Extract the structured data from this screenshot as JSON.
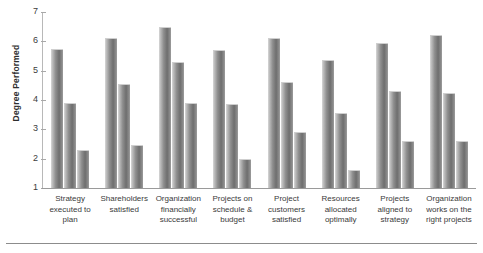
{
  "chart_data": {
    "type": "bar",
    "title": "",
    "subtitle": "",
    "xlabel": "",
    "ylabel": "Degree Performed",
    "ylim": [
      1,
      7
    ],
    "yticks": [
      1,
      2,
      3,
      4,
      5,
      6,
      7
    ],
    "grid": false,
    "legend": "none",
    "orientation": "vertical",
    "grouping": "clustered",
    "categories": [
      "Strategy executed to plan",
      "Shareholders satisfied",
      "Organization financially successful",
      "Projects on schedule & budget",
      "Project customers satisfied",
      "Resources allocated optimally",
      "Projects aligned to strategy",
      "Organization works on the right projects"
    ],
    "category_lines": [
      [
        "Strategy",
        "executed to",
        "plan"
      ],
      [
        "Shareholders",
        "satisfied"
      ],
      [
        "Organization",
        "financially",
        "successful"
      ],
      [
        "Projects on",
        "schedule &",
        "budget"
      ],
      [
        "Project",
        "customers",
        "satisfied"
      ],
      [
        "Resources",
        "allocated",
        "optimally"
      ],
      [
        "Projects",
        "aligned to",
        "strategy"
      ],
      [
        "Organization",
        "works on the",
        "right projects"
      ]
    ],
    "series": [
      {
        "name": "Series 1",
        "values": [
          5.75,
          6.1,
          6.5,
          5.7,
          6.1,
          5.35,
          5.95,
          6.2
        ]
      },
      {
        "name": "Series 2",
        "values": [
          3.9,
          4.55,
          5.3,
          3.85,
          4.6,
          3.55,
          4.3,
          4.25
        ]
      },
      {
        "name": "Series 3",
        "values": [
          2.3,
          2.45,
          3.9,
          2.0,
          2.9,
          1.6,
          2.6,
          2.6
        ]
      }
    ]
  },
  "colors": {
    "bar_light": "#d8d8d8",
    "bar_mid": "#8f8f8f",
    "bar_dark": "#6e6e6e",
    "axis": "#9a9a9a",
    "text": "#3a3a3a",
    "background": "#ffffff"
  }
}
